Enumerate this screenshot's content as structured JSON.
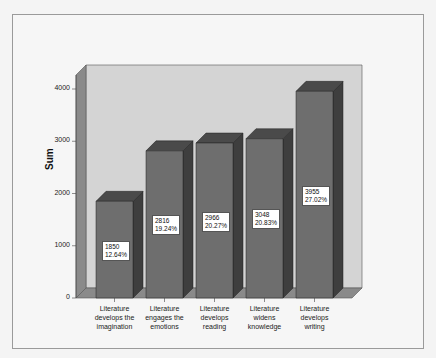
{
  "chart_data": {
    "type": "bar",
    "title": "",
    "xlabel": "",
    "ylabel": "Sum",
    "ylim": [
      0,
      4000
    ],
    "yticks": [
      "0",
      "1000",
      "2000",
      "3000",
      "4000"
    ],
    "categories": [
      "Literature develops the imagination",
      "Literature engages the emotions",
      "Literature develops reading",
      "Literature widens knowledge",
      "Literature develops writing"
    ],
    "values": [
      1850,
      2816,
      2966,
      3048,
      3955
    ],
    "percentages": [
      "12.64%",
      "19.24%",
      "20.27%",
      "20.83%",
      "27.02%"
    ],
    "grid": false,
    "legend": "none",
    "style": "3d"
  },
  "axis": {
    "ylabel": "Sum",
    "ticks": [
      "0",
      "1000",
      "2000",
      "3000",
      "4000"
    ]
  },
  "bars": [
    {
      "label_lines": [
        "Literature",
        "develops the",
        "imagination"
      ],
      "value": "1850",
      "pct": "12.64%"
    },
    {
      "label_lines": [
        "Literature",
        "engages the",
        "emotions"
      ],
      "value": "2816",
      "pct": "19.24%"
    },
    {
      "label_lines": [
        "Literature",
        "develops",
        "reading"
      ],
      "value": "2966",
      "pct": "20.27%"
    },
    {
      "label_lines": [
        "Literature",
        "widens",
        "knowledge"
      ],
      "value": "3048",
      "pct": "20.83%"
    },
    {
      "label_lines": [
        "Literature",
        "develops",
        "writing"
      ],
      "value": "3955",
      "pct": "27.02%"
    }
  ],
  "colors": {
    "bar_front": "#6e6e6e",
    "bar_top": "#4a4a4a",
    "bar_side": "#3e3e3e",
    "back_wall": "#d4d4d4",
    "side_wall": "#8a8a8a",
    "floor": "#8a8a8a"
  }
}
